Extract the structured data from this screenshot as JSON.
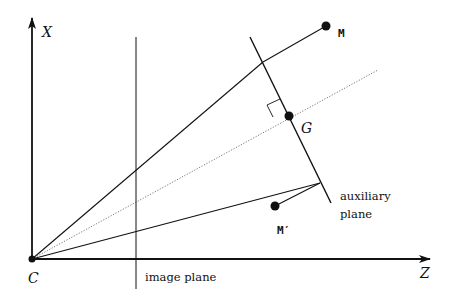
{
  "diagram": {
    "title": "",
    "labels": {
      "x_axis": "X",
      "z_axis": "Z",
      "origin": "C",
      "point_m": "M",
      "point_m_prime": "M′",
      "point_g": "G",
      "image_plane": "image plane",
      "aux_plane_line1": "auxiliary",
      "aux_plane_line2": "plane"
    },
    "points": {
      "C": [
        32,
        259
      ],
      "M": [
        326,
        26
      ],
      "G": [
        289,
        116
      ],
      "M_prime": [
        275,
        206
      ],
      "aux_plane_top": [
        250,
        37
      ],
      "aux_plane_bottom": [
        331,
        203
      ],
      "aux_ray_hit": [
        320,
        183
      ],
      "dotted_end": [
        378,
        70
      ]
    },
    "colors": {
      "stroke": "#111111",
      "dotted": "#555555",
      "background": "#ffffff"
    }
  }
}
